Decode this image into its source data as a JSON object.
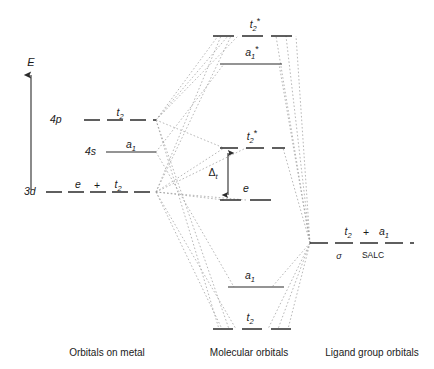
{
  "figure": {
    "type": "molecular-orbital-energy-diagram",
    "symmetry": "tetrahedral",
    "axis": {
      "label": "E",
      "name": "energy-axis",
      "direction": "up"
    },
    "columns": [
      {
        "id": "metal",
        "caption": "Orbitals on metal"
      },
      {
        "id": "mo",
        "caption": "Molecular orbitals"
      },
      {
        "id": "lgo",
        "caption": "Ligand group orbitals"
      }
    ],
    "metal_levels": [
      {
        "id": "metal-4p",
        "orbital": "4p",
        "term": "t",
        "term_sub": "2",
        "term_star": "",
        "style": "dashed",
        "degeneracy": 3
      },
      {
        "id": "metal-4s",
        "orbital": "4s",
        "term": "a",
        "term_sub": "1",
        "term_star": "",
        "style": "solid",
        "degeneracy": 1
      },
      {
        "id": "metal-3d",
        "orbital": "3d",
        "term": "e",
        "term_join": "+",
        "term2": "t",
        "term2_sub": "2",
        "style": "dashed",
        "degeneracy": 5
      }
    ],
    "mo_levels": [
      {
        "id": "mo-t2-antibonding",
        "term": "t",
        "term_sub": "2",
        "term_star": "*",
        "style": "dashed",
        "character": "antibonding"
      },
      {
        "id": "mo-a1-antibonding",
        "term": "a",
        "term_sub": "1",
        "term_star": "*",
        "style": "solid",
        "character": "antibonding"
      },
      {
        "id": "mo-t2-nonbonding",
        "term": "t",
        "term_sub": "2",
        "term_star": "*",
        "style": "dashed",
        "character": "nonbonding-d"
      },
      {
        "id": "mo-e-nonbonding",
        "term": "e",
        "term_sub": "",
        "term_star": "",
        "style": "dashed",
        "character": "nonbonding-d"
      },
      {
        "id": "mo-a1-bonding",
        "term": "a",
        "term_sub": "1",
        "term_star": "",
        "style": "solid",
        "character": "bonding"
      },
      {
        "id": "mo-t2-bonding",
        "term": "t",
        "term_sub": "2",
        "term_star": "",
        "style": "dashed",
        "character": "bonding"
      }
    ],
    "splitting": {
      "label": "Δ",
      "sub": "t",
      "name": "delta-t-splitting",
      "between": [
        "mo-e-nonbonding",
        "mo-t2-nonbonding"
      ]
    },
    "ligand_level": {
      "id": "lgo-salc",
      "term1": "t",
      "term1_sub": "2",
      "join": "+",
      "term2": "a",
      "term2_sub": "1",
      "sigma": "σ",
      "salc": "SALC",
      "style": "dashed"
    },
    "colors": {
      "line": "#2b2b2b",
      "correlation": "#8a8a8a",
      "text": "#1a1a1a",
      "background": "#ffffff"
    }
  }
}
